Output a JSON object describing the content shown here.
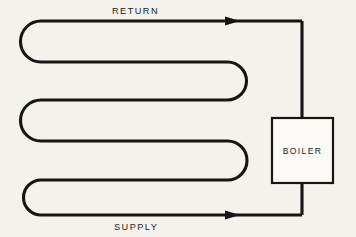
{
  "diagram": {
    "background_color": "#f4f2ed",
    "ink_color": "#151515",
    "labels": {
      "return": "RETURN",
      "supply": "SUPPLY",
      "boiler": "BOILER"
    },
    "components": {
      "boiler": {
        "name": "BOILER",
        "x": 272,
        "y": 118,
        "width": 61,
        "height": 65,
        "fill": "#fbfaf7",
        "stroke": "#151515"
      },
      "return_line": {
        "name": "RETURN",
        "y": 21,
        "flow_direction": "right",
        "arrow_x": 232
      },
      "supply_line": {
        "name": "SUPPLY",
        "y": 215,
        "flow_direction": "right",
        "arrow_x": 232
      },
      "serpentine": {
        "run_y_positions": [
          21,
          62,
          100,
          141,
          180,
          215
        ],
        "left_extent_x": 20,
        "right_extent_x": 248,
        "riser_x": 302,
        "bend_style": "semicircular",
        "run_count": 6
      }
    }
  }
}
